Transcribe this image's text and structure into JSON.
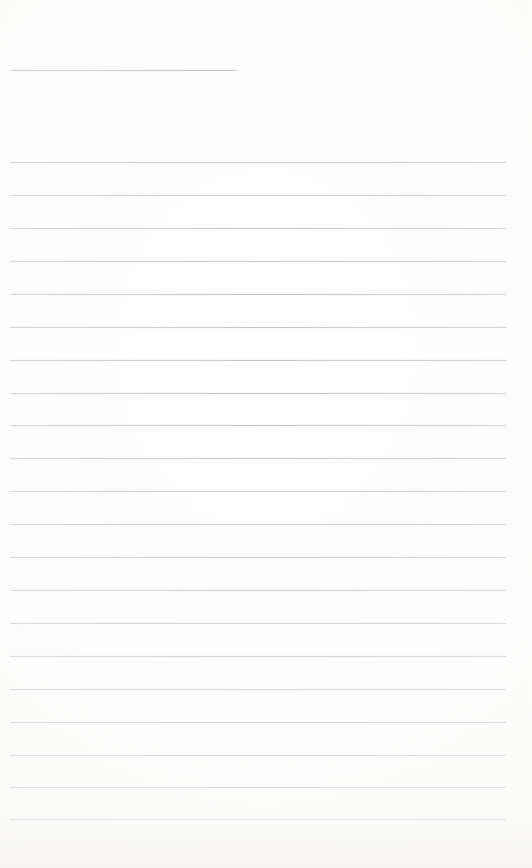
{
  "document": {
    "kind": "scanned-ruled-notepad-page",
    "title": "",
    "body_text": "",
    "page_width": 532,
    "page_height": 868,
    "colors": {
      "paper": "#ffffff",
      "paper_tint": "#f7f6f4",
      "rule_line": "#b9bdc2",
      "header_rule_line": "#a9adb3"
    },
    "ruling": {
      "line_spacing_px": 32.7,
      "line_thickness_px": 1,
      "full_line_left_x": 10,
      "full_line_right_x": 506,
      "header_line_left_x": 10,
      "header_line_right_x": 237,
      "line_count": 21,
      "full_line_count": 20,
      "header_line_count": 1
    },
    "lines": [
      {
        "label": "header-rule",
        "y": 70,
        "left": 10,
        "right": 237,
        "type": "header"
      },
      {
        "label": "rule-line-1",
        "y": 162,
        "left": 10,
        "right": 506,
        "type": "full"
      },
      {
        "label": "rule-line-2",
        "y": 195,
        "left": 10,
        "right": 506,
        "type": "full"
      },
      {
        "label": "rule-line-3",
        "y": 228,
        "left": 10,
        "right": 506,
        "type": "full"
      },
      {
        "label": "rule-line-4",
        "y": 261,
        "left": 10,
        "right": 506,
        "type": "full"
      },
      {
        "label": "rule-line-5",
        "y": 294,
        "left": 10,
        "right": 506,
        "type": "full"
      },
      {
        "label": "rule-line-6",
        "y": 327,
        "left": 10,
        "right": 506,
        "type": "full"
      },
      {
        "label": "rule-line-7",
        "y": 360,
        "left": 10,
        "right": 506,
        "type": "full"
      },
      {
        "label": "rule-line-8",
        "y": 393,
        "left": 10,
        "right": 506,
        "type": "full"
      },
      {
        "label": "rule-line-9",
        "y": 425,
        "left": 10,
        "right": 506,
        "type": "full"
      },
      {
        "label": "rule-line-10",
        "y": 458,
        "left": 10,
        "right": 506,
        "type": "full"
      },
      {
        "label": "rule-line-11",
        "y": 491,
        "left": 10,
        "right": 506,
        "type": "full"
      },
      {
        "label": "rule-line-12",
        "y": 524,
        "left": 10,
        "right": 506,
        "type": "full"
      },
      {
        "label": "rule-line-13",
        "y": 557,
        "left": 10,
        "right": 506,
        "type": "full"
      },
      {
        "label": "rule-line-14",
        "y": 590,
        "left": 10,
        "right": 506,
        "type": "full"
      },
      {
        "label": "rule-line-15",
        "y": 623,
        "left": 10,
        "right": 506,
        "type": "full"
      },
      {
        "label": "rule-line-16",
        "y": 656,
        "left": 10,
        "right": 506,
        "type": "full"
      },
      {
        "label": "rule-line-17",
        "y": 689,
        "left": 10,
        "right": 506,
        "type": "full"
      },
      {
        "label": "rule-line-18",
        "y": 722,
        "left": 10,
        "right": 506,
        "type": "full"
      },
      {
        "label": "rule-line-19",
        "y": 755,
        "left": 10,
        "right": 506,
        "type": "full"
      },
      {
        "label": "rule-line-20",
        "y": 787,
        "left": 10,
        "right": 506,
        "type": "full"
      },
      {
        "label": "rule-line-21",
        "y": 819,
        "left": 10,
        "right": 506,
        "type": "full"
      }
    ]
  }
}
